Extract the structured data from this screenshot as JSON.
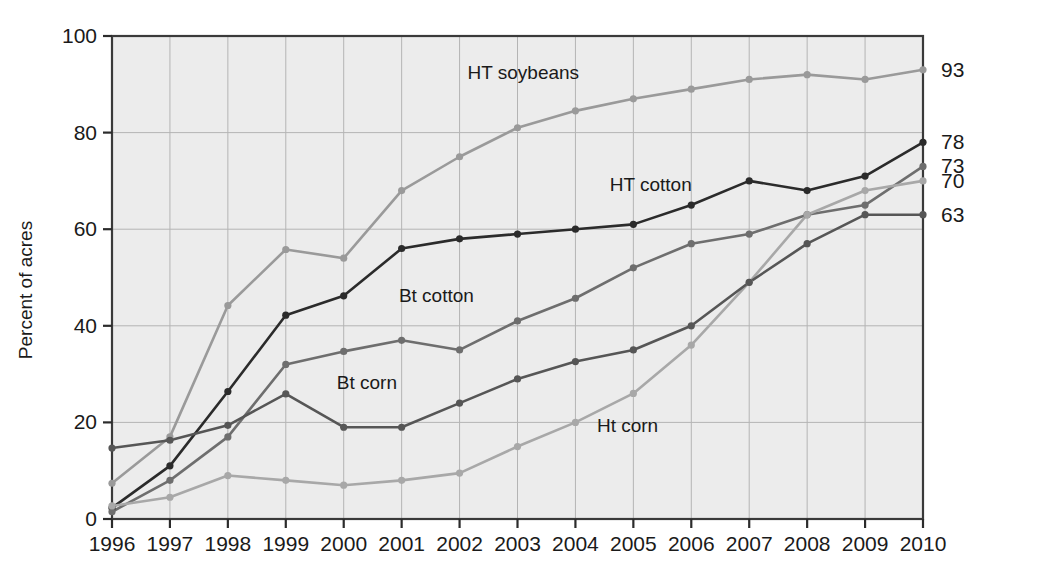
{
  "chart_data": {
    "type": "line",
    "title": "",
    "xlabel": "",
    "ylabel": "Percent of acres",
    "xlim": [
      1996,
      2010
    ],
    "ylim": [
      0,
      100
    ],
    "grid": true,
    "legend_position": "inline-labels",
    "x": [
      1996,
      1997,
      1998,
      1999,
      2000,
      2001,
      2002,
      2003,
      2004,
      2005,
      2006,
      2007,
      2008,
      2009,
      2010
    ],
    "xticklabels": [
      "1996",
      "1997",
      "1998",
      "1999",
      "2000",
      "2001",
      "2002",
      "2003",
      "2004",
      "2005",
      "2006",
      "2007",
      "2008",
      "2009",
      "2010"
    ],
    "yticklabels": [
      "0",
      "20",
      "40",
      "60",
      "80",
      "100"
    ],
    "yticks": [
      0,
      20,
      40,
      60,
      80,
      100
    ],
    "series": [
      {
        "name": "HT soybeans",
        "color": "#9a9a9a",
        "end_label": "93",
        "label_x": 2003.1,
        "label_y": 91,
        "values": [
          7.4,
          17,
          44.2,
          55.8,
          54,
          68,
          75,
          81,
          84.5,
          87,
          89,
          91,
          92,
          91,
          93
        ]
      },
      {
        "name": "HT cotton",
        "color": "#2b2b2b",
        "end_label": "78",
        "label_x": 2005.3,
        "label_y": 68,
        "values": [
          2.3,
          11,
          26.4,
          42.2,
          46.2,
          56,
          58,
          59,
          60,
          61,
          65,
          70,
          68,
          71,
          78
        ]
      },
      {
        "name": "Bt cotton",
        "color": "#6e6e6e",
        "end_label": "73",
        "label_x": 2001.6,
        "label_y": 45,
        "values": [
          1.5,
          8,
          17,
          32,
          34.7,
          37,
          35,
          41,
          45.7,
          52,
          57,
          59,
          63,
          65,
          73
        ]
      },
      {
        "name": "Ht corn",
        "color": "#a8a8a8",
        "end_label": "70",
        "label_x": 2004.9,
        "label_y": 18,
        "values": [
          2.7,
          4.5,
          9,
          8,
          7,
          8,
          9.5,
          15,
          20,
          26,
          36,
          49,
          63,
          68,
          70
        ]
      },
      {
        "name": "Bt corn",
        "color": "#565656",
        "end_label": "63",
        "label_x": 2000.4,
        "label_y": 27,
        "values": [
          14.7,
          16.3,
          19.4,
          25.9,
          19,
          19,
          24,
          29,
          32.6,
          35,
          40,
          49,
          57,
          63,
          63
        ]
      }
    ]
  },
  "plot": {
    "background": "#ececec",
    "frame_color": "#3a3a3a",
    "grid_color": "#b4b4b4"
  }
}
